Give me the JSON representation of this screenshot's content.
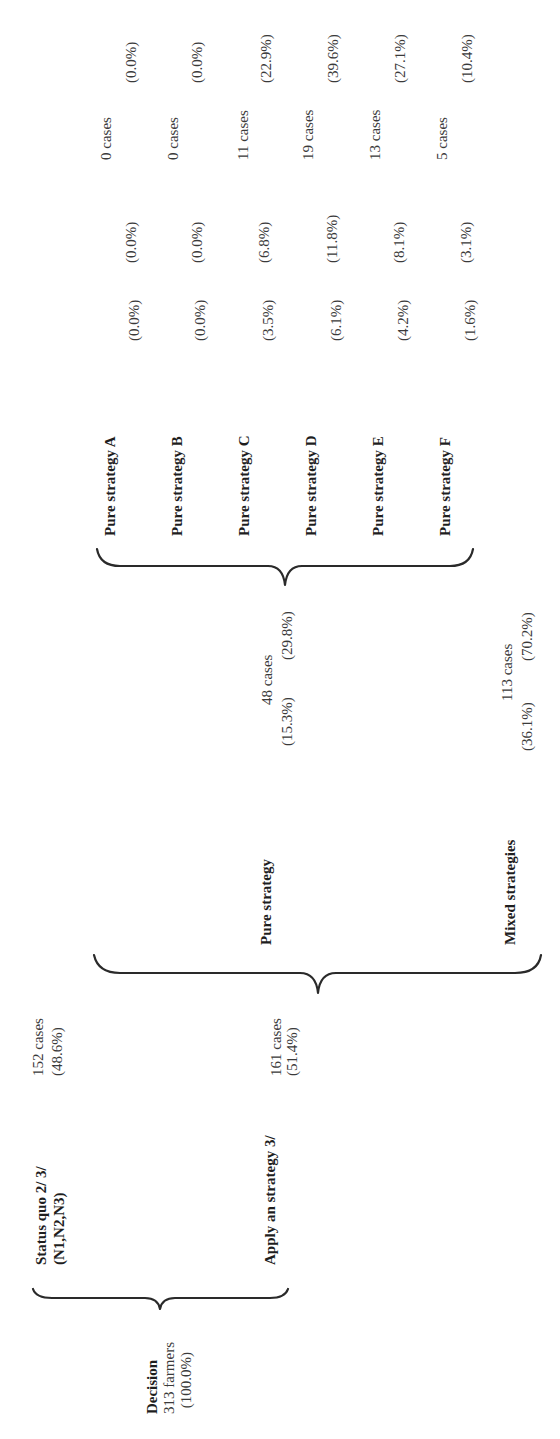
{
  "orientation": "rotated -90 degrees (text reads bottom-to-top)",
  "root": {
    "title": "Decision",
    "count": "313 farmers",
    "percent": "(100.0%)"
  },
  "level1": [
    {
      "label": "Status quo 2/ 3/",
      "sublabel": "(N1,N2,N3)",
      "count": "152 cases",
      "percent": "(48.6%)"
    },
    {
      "label": "Apply an strategy 3/",
      "count": "161 cases",
      "percent": "(51.4%)"
    }
  ],
  "level2": [
    {
      "label": "Pure strategy",
      "count": "48 cases",
      "percent_total": "(15.3%)",
      "percent_of_applied": "(29.8%)"
    },
    {
      "label": "Mixed strategies",
      "count": "113 cases",
      "percent_total": "(36.1%)",
      "percent_of_applied": "(70.2%)"
    }
  ],
  "level3": [
    {
      "label": "Pure strategy A",
      "percent_total": "(0.0%)",
      "percent_of_applied": "(0.0%)",
      "count": "0 cases",
      "percent_of_pure": "(0.0%)"
    },
    {
      "label": "Pure strategy B",
      "percent_total": "(0.0%)",
      "percent_of_applied": "(0.0%)",
      "count": "0 cases",
      "percent_of_pure": "(0.0%)"
    },
    {
      "label": "Pure strategy C",
      "percent_total": "(3.5%)",
      "percent_of_applied": "(6.8%)",
      "count": "11 cases",
      "percent_of_pure": "(22.9%)"
    },
    {
      "label": "Pure strategy D",
      "percent_total": "(6.1%)",
      "percent_of_applied": "(11.8%)",
      "count": "19 cases",
      "percent_of_pure": "(39.6%)"
    },
    {
      "label": "Pure strategy E",
      "percent_total": "(4.2%)",
      "percent_of_applied": "(8.1%)",
      "count": "13 cases",
      "percent_of_pure": "(27.1%)"
    },
    {
      "label": "Pure strategy F",
      "percent_total": "(1.6%)",
      "percent_of_applied": "(3.1%)",
      "count": "5 cases",
      "percent_of_pure": "(10.4%)"
    }
  ]
}
